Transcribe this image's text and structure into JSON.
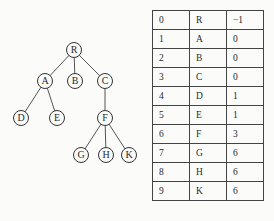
{
  "tree": {
    "nodes": [
      {
        "id": "R",
        "label": "R",
        "x": 74,
        "y": 50
      },
      {
        "id": "A",
        "label": "A",
        "x": 45,
        "y": 81
      },
      {
        "id": "B",
        "label": "B",
        "x": 75,
        "y": 81
      },
      {
        "id": "C",
        "label": "C",
        "x": 105,
        "y": 81
      },
      {
        "id": "D",
        "label": "D",
        "x": 21,
        "y": 118
      },
      {
        "id": "E",
        "label": "E",
        "x": 57,
        "y": 118
      },
      {
        "id": "F",
        "label": "F",
        "x": 105,
        "y": 118
      },
      {
        "id": "G",
        "label": "G",
        "x": 81,
        "y": 155
      },
      {
        "id": "H",
        "label": "H",
        "x": 106,
        "y": 155
      },
      {
        "id": "K",
        "label": "K",
        "x": 129,
        "y": 155
      }
    ],
    "edges": [
      [
        "R",
        "A"
      ],
      [
        "R",
        "B"
      ],
      [
        "R",
        "C"
      ],
      [
        "A",
        "D"
      ],
      [
        "A",
        "E"
      ],
      [
        "C",
        "F"
      ],
      [
        "F",
        "G"
      ],
      [
        "F",
        "H"
      ],
      [
        "F",
        "K"
      ]
    ]
  },
  "table": {
    "rows": [
      [
        "0",
        "R",
        "−1"
      ],
      [
        "1",
        "A",
        "0"
      ],
      [
        "2",
        "B",
        "0"
      ],
      [
        "3",
        "C",
        "0"
      ],
      [
        "4",
        "D",
        "1"
      ],
      [
        "5",
        "E",
        "1"
      ],
      [
        "6",
        "F",
        "3"
      ],
      [
        "7",
        "G",
        "6"
      ],
      [
        "8",
        "H",
        "6"
      ],
      [
        "9",
        "K",
        "6"
      ]
    ]
  }
}
